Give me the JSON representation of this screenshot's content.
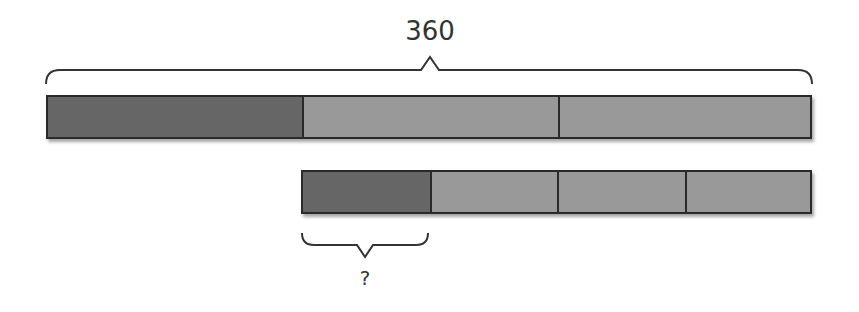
{
  "diagram": {
    "type": "tape-diagram",
    "colors": {
      "dark_segment": "#666666",
      "light_segment": "#999999",
      "outline": "#2a2a2a",
      "text": "#333333"
    },
    "top_bar": {
      "total_label": "360",
      "segments": [
        {
          "shade": "dark",
          "units": 1
        },
        {
          "shade": "light",
          "units": 1
        },
        {
          "shade": "light",
          "units": 1
        }
      ]
    },
    "bottom_bar": {
      "segments": [
        {
          "shade": "dark",
          "units": 1
        },
        {
          "shade": "light",
          "units": 1
        },
        {
          "shade": "light",
          "units": 1
        },
        {
          "shade": "light",
          "units": 1
        }
      ],
      "unknown_label": "?"
    }
  }
}
